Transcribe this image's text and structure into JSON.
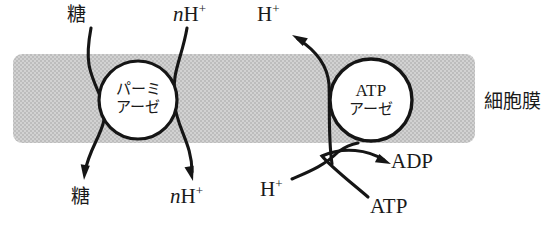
{
  "figure": {
    "kind": "cell-membrane-transport-diagram",
    "background_color": "#ffffff",
    "ink_color": "#1a1a1a"
  },
  "membrane": {
    "label": "細胞膜",
    "fill_color": "#c9c9c9",
    "pattern": "halftone-dither",
    "x": 13,
    "y": 54,
    "width": 462,
    "height": 89,
    "corner_radius": 9,
    "label_x": 484,
    "label_y": 92
  },
  "proteins": [
    {
      "name": "permease",
      "line1": "パーミ",
      "line2": "アーゼ",
      "cx": 138,
      "cy": 100,
      "r": 39,
      "fill": "#ffffff",
      "stroke": "#151515",
      "stroke_width": 3.2
    },
    {
      "name": "atpase",
      "line1": "ATP",
      "line2": "アーゼ",
      "cx": 371,
      "cy": 100,
      "r": 41,
      "fill": "#ffffff",
      "stroke": "#151515",
      "stroke_width": 3.4
    }
  ],
  "labels": {
    "sugar_top": "糖",
    "sugar_bottom": "糖",
    "protons_top_n": "n",
    "protons_top_h": "H",
    "protons_top_charge": "+",
    "protons_bottom_n": "n",
    "protons_bottom_h": "H",
    "protons_bottom_charge": "+",
    "proton_out_h": "H",
    "proton_out_charge": "+",
    "proton_in_h": "H",
    "proton_in_charge": "+",
    "adp": "ADP",
    "atp": "ATP"
  },
  "label_positions": {
    "sugar_top": {
      "x": 67,
      "y": 5
    },
    "protons_top": {
      "x": 173,
      "y": 4
    },
    "proton_out": {
      "x": 257,
      "y": 4
    },
    "sugar_bottom": {
      "x": 71,
      "y": 187
    },
    "protons_bottom": {
      "x": 170,
      "y": 186
    },
    "proton_in": {
      "x": 260,
      "y": 179
    },
    "adp": {
      "x": 391,
      "y": 151
    },
    "atp": {
      "x": 370,
      "y": 196
    }
  },
  "arrows": [
    {
      "name": "sugar-influx-arrow",
      "from_label": "糖",
      "to_label": "糖",
      "direction": "inward-downward",
      "path": "M 91,28 C 85,60 88,70 102,100 C 112,126 90,142 85,172",
      "head_at": [
        84,
        180
      ],
      "head_angle": 100
    },
    {
      "name": "proton-influx-arrow",
      "from_label": "nH+",
      "to_label": "nH+",
      "direction": "inward-downward",
      "path": "M 187,28 C 182,58 172,70 174,100 C 176,128 192,142 192,172",
      "head_at": [
        193,
        181
      ],
      "head_angle": 80
    },
    {
      "name": "proton-efflux-arrow",
      "from_label": "H+ (inside)",
      "to_label": "H+ (outside)",
      "direction": "outward-upward",
      "path": "M 332,164 C 328,136 330,110 329,84 C 327,62 312,48 298,39",
      "head_at": [
        292,
        35
      ],
      "head_angle": 213
    },
    {
      "name": "atp-hydrolysis-arrow",
      "from_label": "ATP",
      "to_label": "ADP",
      "direction": "rightward",
      "path": "M 368,197 C 348,180 330,166 322,156 C 344,146 368,150 384,160",
      "head_at": [
        391,
        164
      ],
      "head_angle": 28
    },
    {
      "name": "proton-entry-curve",
      "from_label": "H+ (inside)",
      "to_label": "atpase",
      "direction": "upward-right",
      "path": "M 292,179 C 308,172 324,166 338,152 C 346,146 352,144 358,143",
      "head_at": null
    }
  ]
}
